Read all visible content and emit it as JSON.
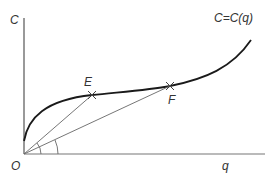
{
  "diagram": {
    "y_axis_label": "C",
    "x_axis_label": "q",
    "origin_label": "O",
    "curve_label": "C=C(q)",
    "points": [
      {
        "label": "E",
        "x": 92,
        "y": 95
      },
      {
        "label": "F",
        "x": 170,
        "y": 86
      }
    ],
    "colors": {
      "axis": "#555555",
      "curve": "#1a1a1a",
      "ray": "#666666",
      "text": "#333333"
    }
  }
}
